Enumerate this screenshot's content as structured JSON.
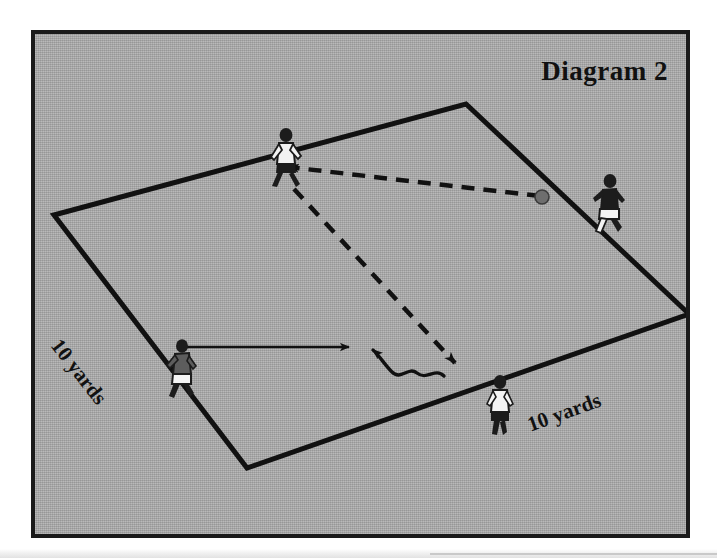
{
  "page": {
    "title": "Diagram 2",
    "background_color": "#ffffff",
    "panel_color": "#a9a9a9",
    "frame_color": "#1a1a1a"
  },
  "diagram": {
    "name": "soccer-drill-diagram",
    "title": "Diagram 2",
    "grid_shape": "diamond",
    "labels": {
      "left_side": "10 yards",
      "right_side": "10 yards"
    },
    "colors": {
      "line": "#111111",
      "ball": "#6e6e6e",
      "pitch": "#a9a9a9"
    },
    "field_corners": {
      "left": [
        50,
        211
      ],
      "top": [
        462,
        100
      ],
      "right": [
        685,
        310
      ],
      "bottom": [
        243,
        464
      ]
    },
    "players": [
      {
        "id": "player-top",
        "shirt": "white",
        "shorts": "dark",
        "x": 248,
        "y": 100
      },
      {
        "id": "player-right",
        "shirt": "dark",
        "shorts": "white",
        "x": 568,
        "y": 145
      },
      {
        "id": "player-left",
        "shirt": "dark",
        "shorts": "white",
        "x": 135,
        "y": 310
      },
      {
        "id": "player-bottom-right",
        "shirt": "white",
        "shorts": "dark",
        "x": 455,
        "y": 347
      }
    ],
    "ball": {
      "x": 538,
      "y": 193,
      "radius": 7
    },
    "arrows": [
      {
        "id": "dashed-pass-arrow",
        "style": "dashed",
        "from": [
          536,
          192
        ],
        "to": [
          284,
          163
        ],
        "meaning": "pass"
      },
      {
        "id": "dashed-run-arrow",
        "style": "dashed",
        "from": [
          290,
          185
        ],
        "to": [
          452,
          360
        ],
        "meaning": "run"
      },
      {
        "id": "solid-run-arrow",
        "style": "solid",
        "from": [
          175,
          343
        ],
        "to": [
          347,
          343
        ],
        "meaning": "run"
      },
      {
        "id": "wavy-dribble-arrow",
        "style": "wavy",
        "from": [
          440,
          372
        ],
        "to": [
          366,
          344
        ],
        "meaning": "dribble"
      }
    ]
  }
}
